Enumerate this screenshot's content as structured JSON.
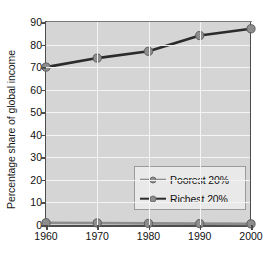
{
  "chart_data": {
    "type": "line",
    "title": "",
    "xlabel": "",
    "ylabel": "Percentage share of global income",
    "x": [
      1960,
      1970,
      1980,
      1990,
      2000
    ],
    "xtick_labels": [
      "1960",
      "1970",
      "1980",
      "1990",
      "2000"
    ],
    "ytick_labels": [
      "0",
      "10",
      "20",
      "30",
      "40",
      "50",
      "60",
      "70",
      "80",
      "90"
    ],
    "ytick_values": [
      0,
      10,
      20,
      30,
      40,
      50,
      60,
      70,
      80,
      90
    ],
    "xlim": [
      1960,
      2000
    ],
    "ylim": [
      0,
      90
    ],
    "grid": true,
    "legend_position": "center-right-inside",
    "plot_background": "#d5d5d5",
    "gridline_color": "#f4f4f4",
    "axis_color": "#4d4d4d",
    "series": [
      {
        "name": "Poorest 20%",
        "values": [
          1.0,
          0.9,
          0.7,
          0.6,
          0.5
        ],
        "line_color": "#8d8d8d",
        "marker_color": "#8d8d8d"
      },
      {
        "name": "Richest 20%",
        "values": [
          70,
          74,
          77,
          84,
          87
        ],
        "line_color": "#2b2b2b",
        "marker_color": "#8d8d8d"
      }
    ]
  },
  "legend": {
    "items": [
      {
        "label": "Poorest 20%"
      },
      {
        "label": "Richest 20%"
      }
    ]
  }
}
